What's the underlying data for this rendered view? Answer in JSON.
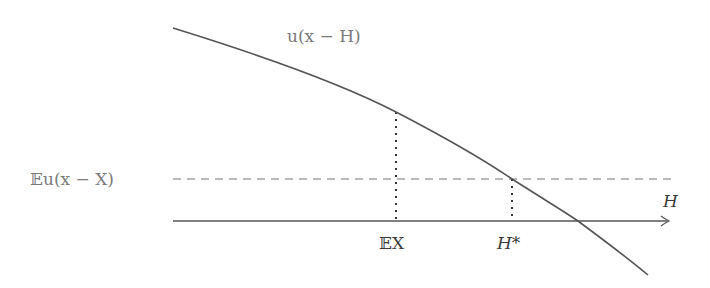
{
  "diagram": {
    "curve_label": "u(x − H)",
    "level_label": "𝔼u(x − X)",
    "axis_label": "H",
    "tick_labels": [
      {
        "text": "𝔼X",
        "x": 396
      },
      {
        "text": "H*",
        "x": 512
      }
    ],
    "colors": {
      "curve": "#555555",
      "axis": "#555555",
      "dashed": "#777777",
      "dotted": "#333333",
      "label_light": "#7a7a7a",
      "label_dark": "#3a3a3a"
    }
  }
}
